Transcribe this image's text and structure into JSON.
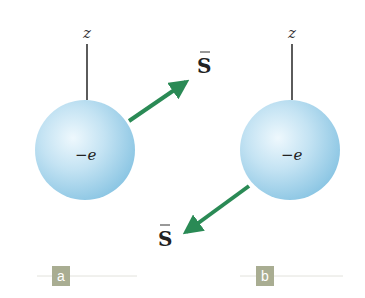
{
  "figure": {
    "panels": [
      {
        "id": "a",
        "label": "a",
        "axis_label": "z",
        "charge_label": "−e",
        "spin_label": "S",
        "spin_direction": "up-right"
      },
      {
        "id": "b",
        "label": "b",
        "axis_label": "z",
        "charge_label": "−e",
        "spin_label": "S",
        "spin_direction": "down-left"
      }
    ],
    "colors": {
      "sphere_light": "#e8f4fb",
      "sphere_mid": "#b8dcef",
      "sphere_dark": "#7fbfe0",
      "arrow": "#2a8a55",
      "axis_line": "#333333",
      "panel_badge": "#a9ad92",
      "baseline": "#e2e2dc"
    }
  }
}
